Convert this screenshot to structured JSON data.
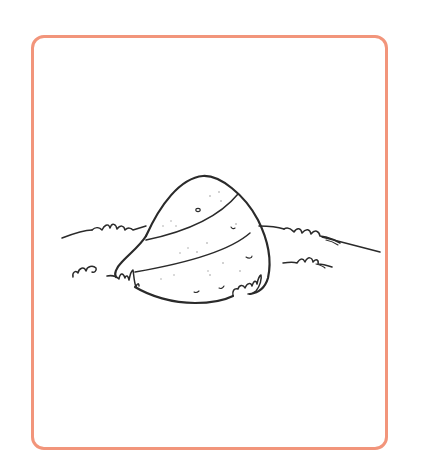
{
  "illustration": {
    "subject": "egg-in-grass",
    "style": "line-art coloring page",
    "alt_text": "A striped egg resting in grass"
  },
  "frame": {
    "border_color": "#F2957B",
    "background_color": "#FFFFFF"
  },
  "colors": {
    "ink": "#2A2A2A",
    "page_background": "#FFFFFF"
  }
}
